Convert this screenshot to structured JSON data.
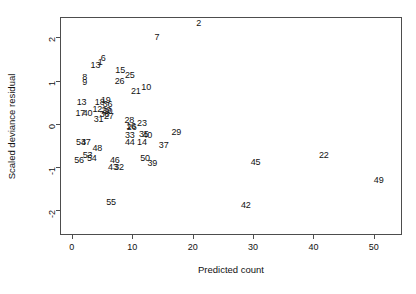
{
  "chart_data": {
    "type": "scatter",
    "title": "",
    "xlabel": "Predicted count",
    "ylabel": "Scaled deviance residual",
    "xlim": [
      -1.8,
      54.5
    ],
    "ylim": [
      -2.55,
      2.45
    ],
    "xticks": [
      0,
      10,
      20,
      30,
      40,
      50
    ],
    "yticks": [
      2,
      1,
      0,
      -1,
      -2
    ],
    "xtick_labels": [
      "0",
      "10",
      "20",
      "30",
      "40",
      "50"
    ],
    "ytick_labels": [
      "2",
      "1",
      "0",
      "-1",
      "-2"
    ],
    "grid": false,
    "legend": null,
    "marker": "text-label",
    "note": "Points are drawn as their observation-number labels rather than plotting symbols.",
    "points": [
      {
        "label": "2",
        "x": 21.0,
        "y": 2.33
      },
      {
        "label": "7",
        "x": 14.1,
        "y": 2.02
      },
      {
        "label": "6",
        "x": 5.2,
        "y": 1.52
      },
      {
        "label": "1",
        "x": 4.7,
        "y": 1.44
      },
      {
        "label": "13",
        "x": 3.9,
        "y": 1.36
      },
      {
        "label": "15",
        "x": 8.0,
        "y": 1.25
      },
      {
        "label": "25",
        "x": 9.6,
        "y": 1.14
      },
      {
        "label": "8",
        "x": 2.1,
        "y": 1.08
      },
      {
        "label": "26",
        "x": 7.9,
        "y": 1.0
      },
      {
        "label": "9",
        "x": 2.1,
        "y": 0.96
      },
      {
        "label": "10",
        "x": 12.3,
        "y": 0.85
      },
      {
        "label": "21",
        "x": 10.6,
        "y": 0.76
      },
      {
        "label": "19",
        "x": 5.6,
        "y": 0.56
      },
      {
        "label": "13",
        "x": 1.6,
        "y": 0.5
      },
      {
        "label": "18",
        "x": 4.6,
        "y": 0.5
      },
      {
        "label": "36",
        "x": 5.9,
        "y": 0.45
      },
      {
        "label": "12",
        "x": 4.2,
        "y": 0.35
      },
      {
        "label": "29",
        "x": 5.7,
        "y": 0.33
      },
      {
        "label": "30",
        "x": 5.9,
        "y": 0.29
      },
      {
        "label": "17",
        "x": 1.4,
        "y": 0.24
      },
      {
        "label": "40",
        "x": 2.6,
        "y": 0.24
      },
      {
        "label": "38",
        "x": 5.4,
        "y": 0.22
      },
      {
        "label": "27",
        "x": 6.1,
        "y": 0.18
      },
      {
        "label": "31",
        "x": 4.4,
        "y": 0.11
      },
      {
        "label": "28",
        "x": 9.5,
        "y": 0.1
      },
      {
        "label": "23",
        "x": 11.6,
        "y": 0.02
      },
      {
        "label": "16",
        "x": 9.8,
        "y": -0.04
      },
      {
        "label": "26",
        "x": 9.9,
        "y": -0.08
      },
      {
        "label": "33",
        "x": 9.6,
        "y": -0.26
      },
      {
        "label": "35",
        "x": 11.9,
        "y": -0.23
      },
      {
        "label": "40",
        "x": 12.5,
        "y": -0.26
      },
      {
        "label": "29",
        "x": 17.3,
        "y": -0.2
      },
      {
        "label": "44",
        "x": 9.6,
        "y": -0.41
      },
      {
        "label": "14",
        "x": 11.6,
        "y": -0.42
      },
      {
        "label": "37",
        "x": 15.2,
        "y": -0.5
      },
      {
        "label": "53",
        "x": 1.5,
        "y": -0.42
      },
      {
        "label": "47",
        "x": 2.3,
        "y": -0.42
      },
      {
        "label": "48",
        "x": 4.2,
        "y": -0.55
      },
      {
        "label": "53",
        "x": 2.6,
        "y": -0.72
      },
      {
        "label": "54",
        "x": 3.3,
        "y": -0.8
      },
      {
        "label": "56",
        "x": 1.2,
        "y": -0.84
      },
      {
        "label": "46",
        "x": 7.1,
        "y": -0.84
      },
      {
        "label": "50",
        "x": 12.1,
        "y": -0.8
      },
      {
        "label": "39",
        "x": 13.3,
        "y": -0.9
      },
      {
        "label": "43",
        "x": 6.8,
        "y": -1.0
      },
      {
        "label": "32",
        "x": 7.8,
        "y": -1.0
      },
      {
        "label": "45",
        "x": 30.4,
        "y": -0.88
      },
      {
        "label": "22",
        "x": 41.7,
        "y": -0.72
      },
      {
        "label": "49",
        "x": 50.8,
        "y": -1.31
      },
      {
        "label": "55",
        "x": 6.5,
        "y": -1.82
      },
      {
        "label": "42",
        "x": 28.8,
        "y": -1.88
      }
    ]
  }
}
